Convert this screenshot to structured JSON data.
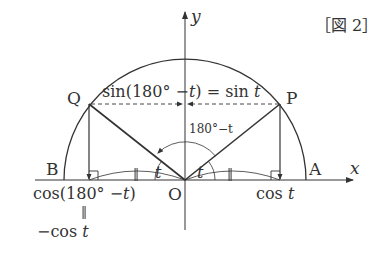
{
  "figure": {
    "label": "［図 2］",
    "axes": {
      "x_label": "x",
      "y_label": "y"
    },
    "points": {
      "O": "O",
      "A": "A",
      "B": "B",
      "P": "P",
      "Q": "Q"
    },
    "annotations": {
      "sin_relation": "sin(180° − t) = sin t",
      "sin_prefix": "sin(180° −",
      "sin_t": "t",
      "sin_mid": ") = sin",
      "sin_t2": "t",
      "angle_obtuse": "180°−t",
      "angle_t_left": "t",
      "angle_t_right": "t",
      "cos_t": "cos",
      "cos_t_var": "t",
      "cos_180": "cos(180° −",
      "cos_180_var": "t",
      "cos_180_close": ")",
      "equals_vertical": "||",
      "neg_cos": "−cos",
      "neg_cos_var": "t",
      "tick_left": "||",
      "tick_right": "||"
    },
    "geometry": {
      "origin": [
        185,
        180
      ],
      "radius": 121,
      "P": [
        280,
        104
      ],
      "Q": [
        90,
        104
      ]
    }
  }
}
